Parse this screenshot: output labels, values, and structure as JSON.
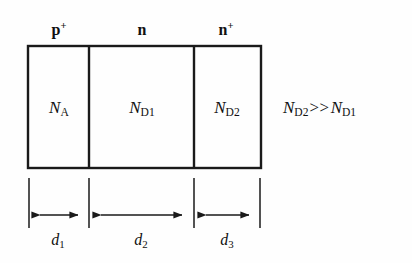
{
  "figure": {
    "background_color": "#fefefe",
    "line_color": "#1a1a1a"
  },
  "regions": [
    {
      "id": "p-plus",
      "label_base": "p",
      "label_sup": "+",
      "doping_base": "N",
      "doping_sub": "A",
      "center_x": 59,
      "label_x": 59,
      "label_y": 22
    },
    {
      "id": "n",
      "label_base": "n",
      "label_sup": "",
      "doping_base": "N",
      "doping_sub": "D1",
      "center_x": 142,
      "label_x": 142,
      "label_y": 22
    },
    {
      "id": "n-plus",
      "label_base": "n",
      "label_sup": "+",
      "doping_base": "N",
      "doping_sub": "D2",
      "center_x": 227,
      "label_x": 226,
      "label_y": 22
    }
  ],
  "region_labels": {
    "p_plus_base": "p",
    "p_plus_sup": "+",
    "n_base": "n",
    "n_plus_base": "n",
    "n_plus_sup": "+"
  },
  "doping_labels": {
    "na_base": "N",
    "na_sub": "A",
    "nd1_base": "N",
    "nd1_sub": "D1",
    "nd2_base": "N",
    "nd2_sub": "D2"
  },
  "inequality": {
    "left_base": "N",
    "left_sub": "D2",
    "operator": ">>",
    "right_base": "N",
    "right_sub": "D1",
    "full_text": "N_D2 >> N_D1"
  },
  "dimensions": [
    {
      "id": "d1",
      "base": "d",
      "sub": "1",
      "x_start": 28,
      "x_end": 89,
      "label_x": 58,
      "label_y": 232
    },
    {
      "id": "d2",
      "base": "d",
      "sub": "2",
      "x_start": 89,
      "x_end": 194,
      "label_x": 141,
      "label_y": 232
    },
    {
      "id": "d3",
      "base": "d",
      "sub": "3",
      "x_start": 194,
      "x_end": 261,
      "label_x": 227,
      "label_y": 232
    }
  ],
  "geometry": {
    "box_left": 28,
    "box_right": 261,
    "box_top": 46,
    "box_bottom": 168,
    "divider_1_x": 89,
    "divider_2_x": 194,
    "interior_center_y": 107,
    "extension_top_y": 178,
    "extension_bottom_y": 228,
    "dim_line_y": 215,
    "inequality_x": 283,
    "inequality_y": 107
  }
}
